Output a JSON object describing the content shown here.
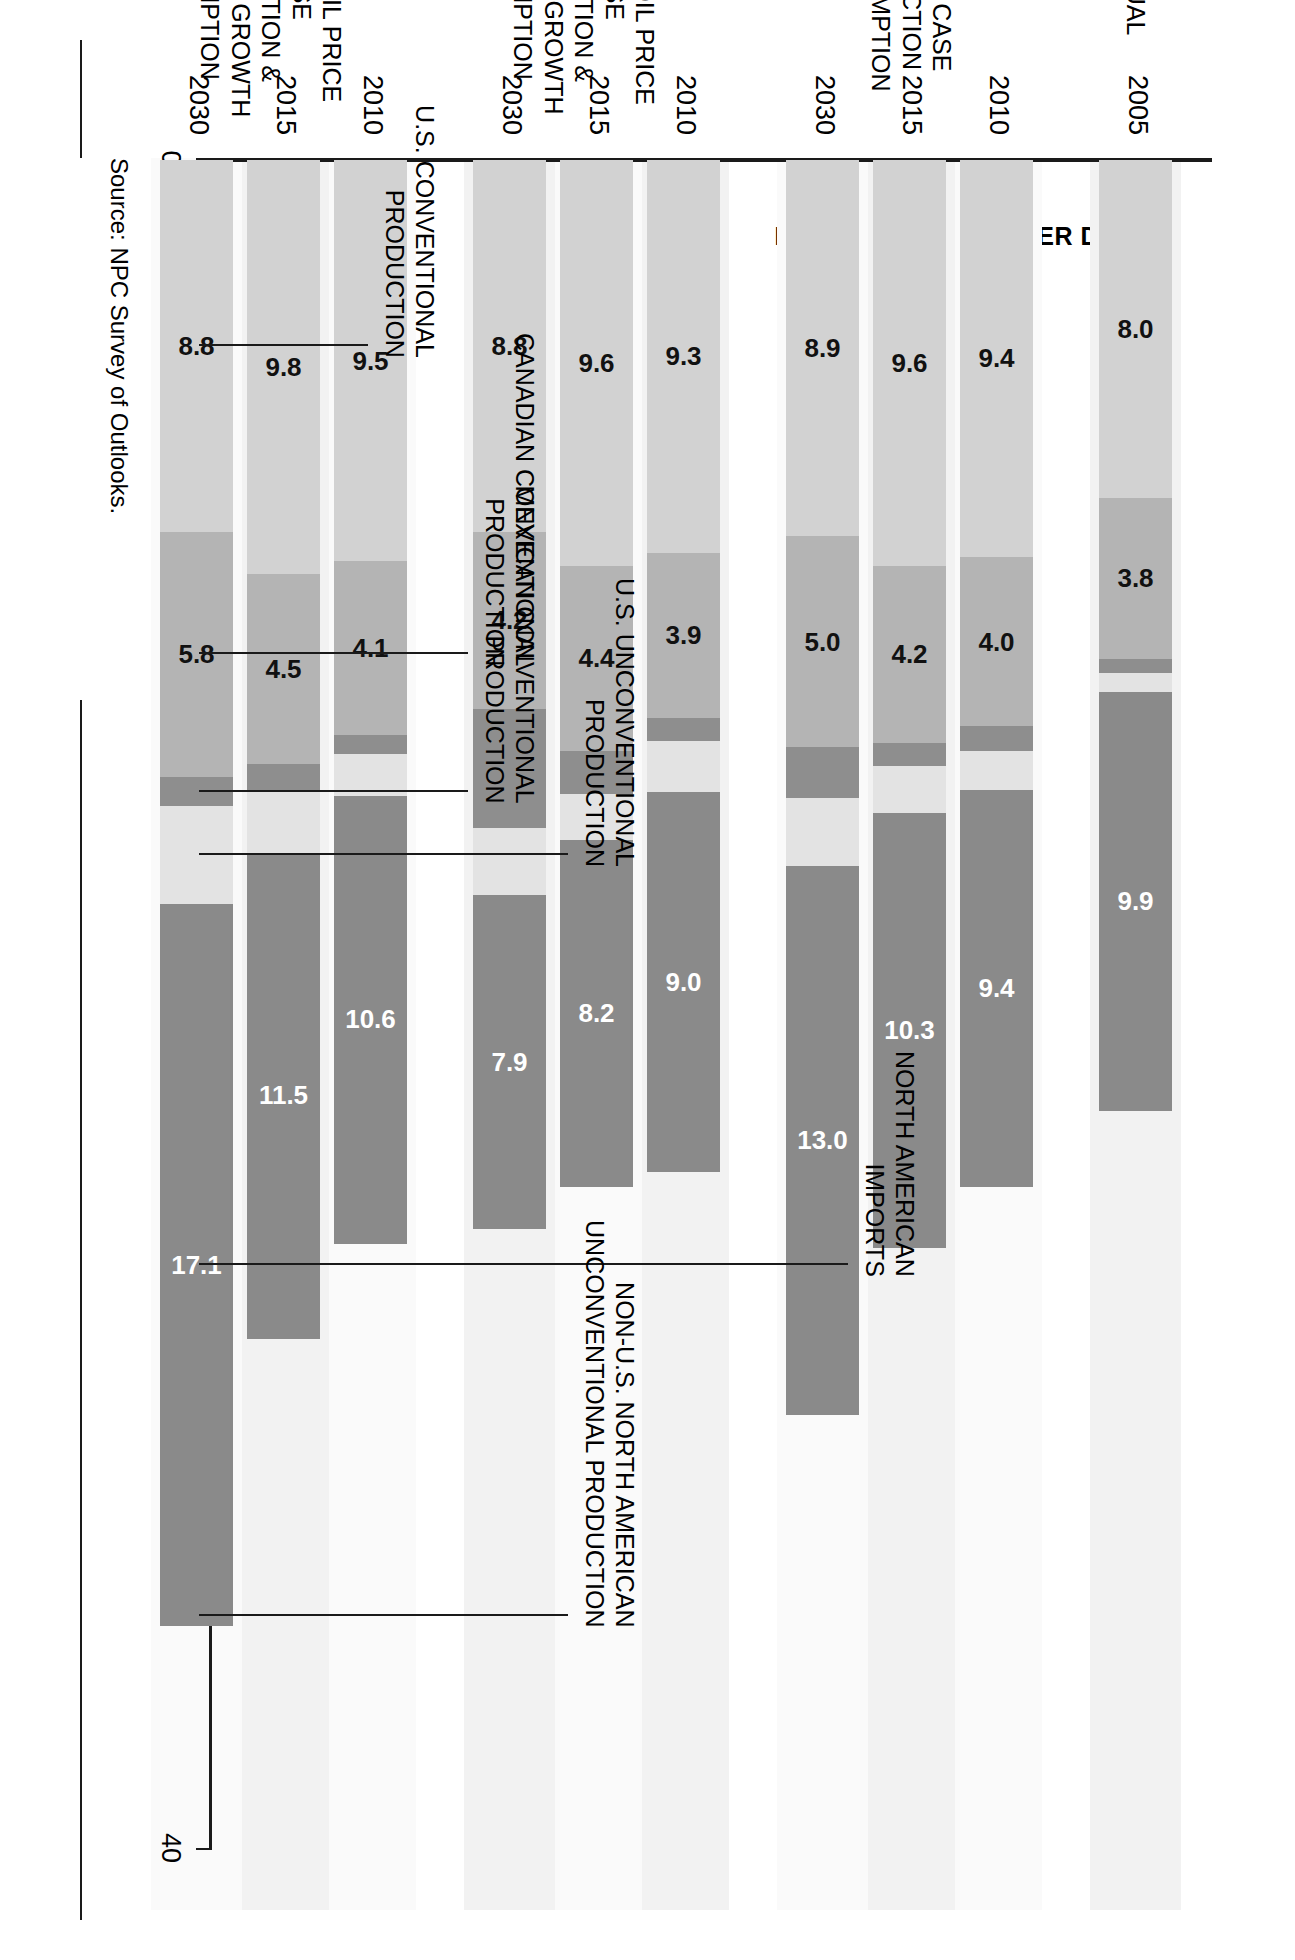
{
  "figure": {
    "y_axis_title": "MILLION BARRELS PER DAY",
    "source": "Source:  NPC Survey of Outlooks."
  },
  "axis": {
    "ticks": [
      "0",
      "10",
      "20",
      "30",
      "40"
    ]
  },
  "callouts": [
    {
      "id": "north-american-imports",
      "label": "NORTH AMERICAN\nIMPORTS"
    },
    {
      "id": "non-us-na-unconventional",
      "label": "NON-U.S. NORTH AMERICAN\nUNCONVENTIONAL PRODUCTION"
    },
    {
      "id": "us-unconventional",
      "label": "U.S. UNCONVENTIONAL\nPRODUCTION"
    },
    {
      "id": "mexican-conventional",
      "label": "MEXICAN CONVENTIONAL\nPRODUCTION"
    },
    {
      "id": "canadian-conventional",
      "label": "CANADIAN CONVENTIONAL\nPRODUCTION"
    },
    {
      "id": "us-conventional",
      "label": "U.S. CONVENTIONAL\nPRODUCTION"
    }
  ],
  "groups": [
    {
      "id": "actual",
      "label": "ACTUAL"
    },
    {
      "id": "ref",
      "label": "EIA REF CASE\nPRODUCTION\n& CONSUMPTION"
    },
    {
      "id": "high",
      "label": "EIA HIGH OIL PRICE CASE\nPRODUCTION &\nLOW ECON GROWTH\nCONSUMPTION"
    },
    {
      "id": "low",
      "label": "EIA LOW OIL PRICE CASE\nPRODUCTION &\nHIGH ECON GROWTH\nCONSUMPTION"
    }
  ],
  "chart_data": {
    "type": "bar",
    "title": "",
    "xlabel": "",
    "ylabel": "MILLION BARRELS PER DAY",
    "ylim": [
      0,
      40
    ],
    "yticks": [
      0,
      10,
      20,
      30,
      40
    ],
    "grid": false,
    "stacked": true,
    "orientation": "vertical",
    "legend": "callout-labels",
    "categories": [
      "2005",
      "2010",
      "2015",
      "2030",
      "2010",
      "2015",
      "2030",
      "2010",
      "2015",
      "2030"
    ],
    "category_groups": [
      "ACTUAL",
      "EIA REF CASE",
      "EIA REF CASE",
      "EIA REF CASE",
      "EIA HIGH OIL PRICE CASE",
      "EIA HIGH OIL PRICE CASE",
      "EIA HIGH OIL PRICE CASE",
      "EIA LOW OIL PRICE CASE",
      "EIA LOW OIL PRICE CASE",
      "EIA LOW OIL PRICE CASE"
    ],
    "series": [
      {
        "name": "U.S. CONVENTIONAL PRODUCTION",
        "color": "#d2d2d2",
        "values": [
          8.0,
          9.4,
          9.6,
          8.9,
          9.3,
          9.6,
          8.8,
          9.5,
          9.8,
          8.8
        ],
        "labels": [
          "8.0",
          "9.4",
          "9.6",
          "8.9",
          "9.3",
          "9.6",
          "8.8",
          "9.5",
          "9.8",
          "8.8"
        ]
      },
      {
        "name": "CANADIAN CONVENTIONAL PRODUCTION",
        "color": "#b4b4b4",
        "values": [
          3.8,
          4.0,
          4.2,
          5.0,
          3.9,
          4.4,
          4.2,
          4.1,
          4.5,
          5.8
        ],
        "labels": [
          "3.8",
          "4.0",
          "4.2",
          "5.0",
          "3.9",
          "4.4",
          "4.2",
          "4.1",
          "4.5",
          "5.8"
        ]
      },
      {
        "name": "MEXICAN CONVENTIONAL PRODUCTION",
        "color": "#8e8e8e",
        "values": [
          0.35,
          0.6,
          0.55,
          1.2,
          0.55,
          1.0,
          2.8,
          0.45,
          0.6,
          0.7
        ],
        "labels": [
          "",
          "",
          "",
          "",
          "",
          "",
          "",
          "",
          "",
          ""
        ]
      },
      {
        "name": "U.S. UNCONVENTIONAL PRODUCTION",
        "color": "#e3e3e3",
        "values": [
          0.45,
          0.9,
          1.1,
          1.6,
          1.2,
          1.1,
          1.6,
          1.0,
          1.5,
          2.3
        ],
        "labels": [
          "",
          "",
          "",
          "",
          "",
          "",
          "",
          "",
          "",
          ""
        ]
      },
      {
        "name": "NON-U.S. NORTH AMERICAN UNCONVENTIONAL PRODUCTION",
        "color": "#8a8a8a",
        "values": [
          9.9,
          9.4,
          10.3,
          13.0,
          9.0,
          8.2,
          7.9,
          10.6,
          11.5,
          17.1
        ],
        "labels": [
          "9.9",
          "9.4",
          "10.3",
          "13.0",
          "9.0",
          "8.2",
          "7.9",
          "10.6",
          "11.5",
          "17.1"
        ]
      }
    ]
  }
}
